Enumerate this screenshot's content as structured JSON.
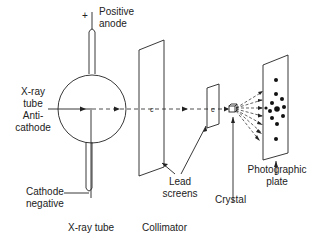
{
  "diagram": {
    "colors": {
      "line": "#222222",
      "background": "#ffffff"
    },
    "labels": {
      "plus_sign": "+",
      "positive_anode_line1": "Positive",
      "positive_anode_line2": "anode",
      "xray_tube_line1": "X-ray",
      "xray_tube_line2": "tube",
      "anticathode_line1": "Anti-",
      "anticathode_line2": "cathode",
      "cathode_line1": "Cathode",
      "cathode_line2": "negative",
      "lead_screens_line1": "Lead",
      "lead_screens_line2": "screens",
      "crystal": "Crystal",
      "photographic_plate_line1": "Photographic",
      "photographic_plate_line2": "plate",
      "beam_marker_1": "c",
      "beam_marker_2": "c"
    },
    "captions": {
      "xray_tube": "X-ray tube",
      "collimator": "Collimator"
    },
    "components": [
      "X-ray tube",
      "Collimator",
      "Lead screens",
      "Crystal",
      "Photographic plate"
    ],
    "diffraction_spot_count": 12
  }
}
